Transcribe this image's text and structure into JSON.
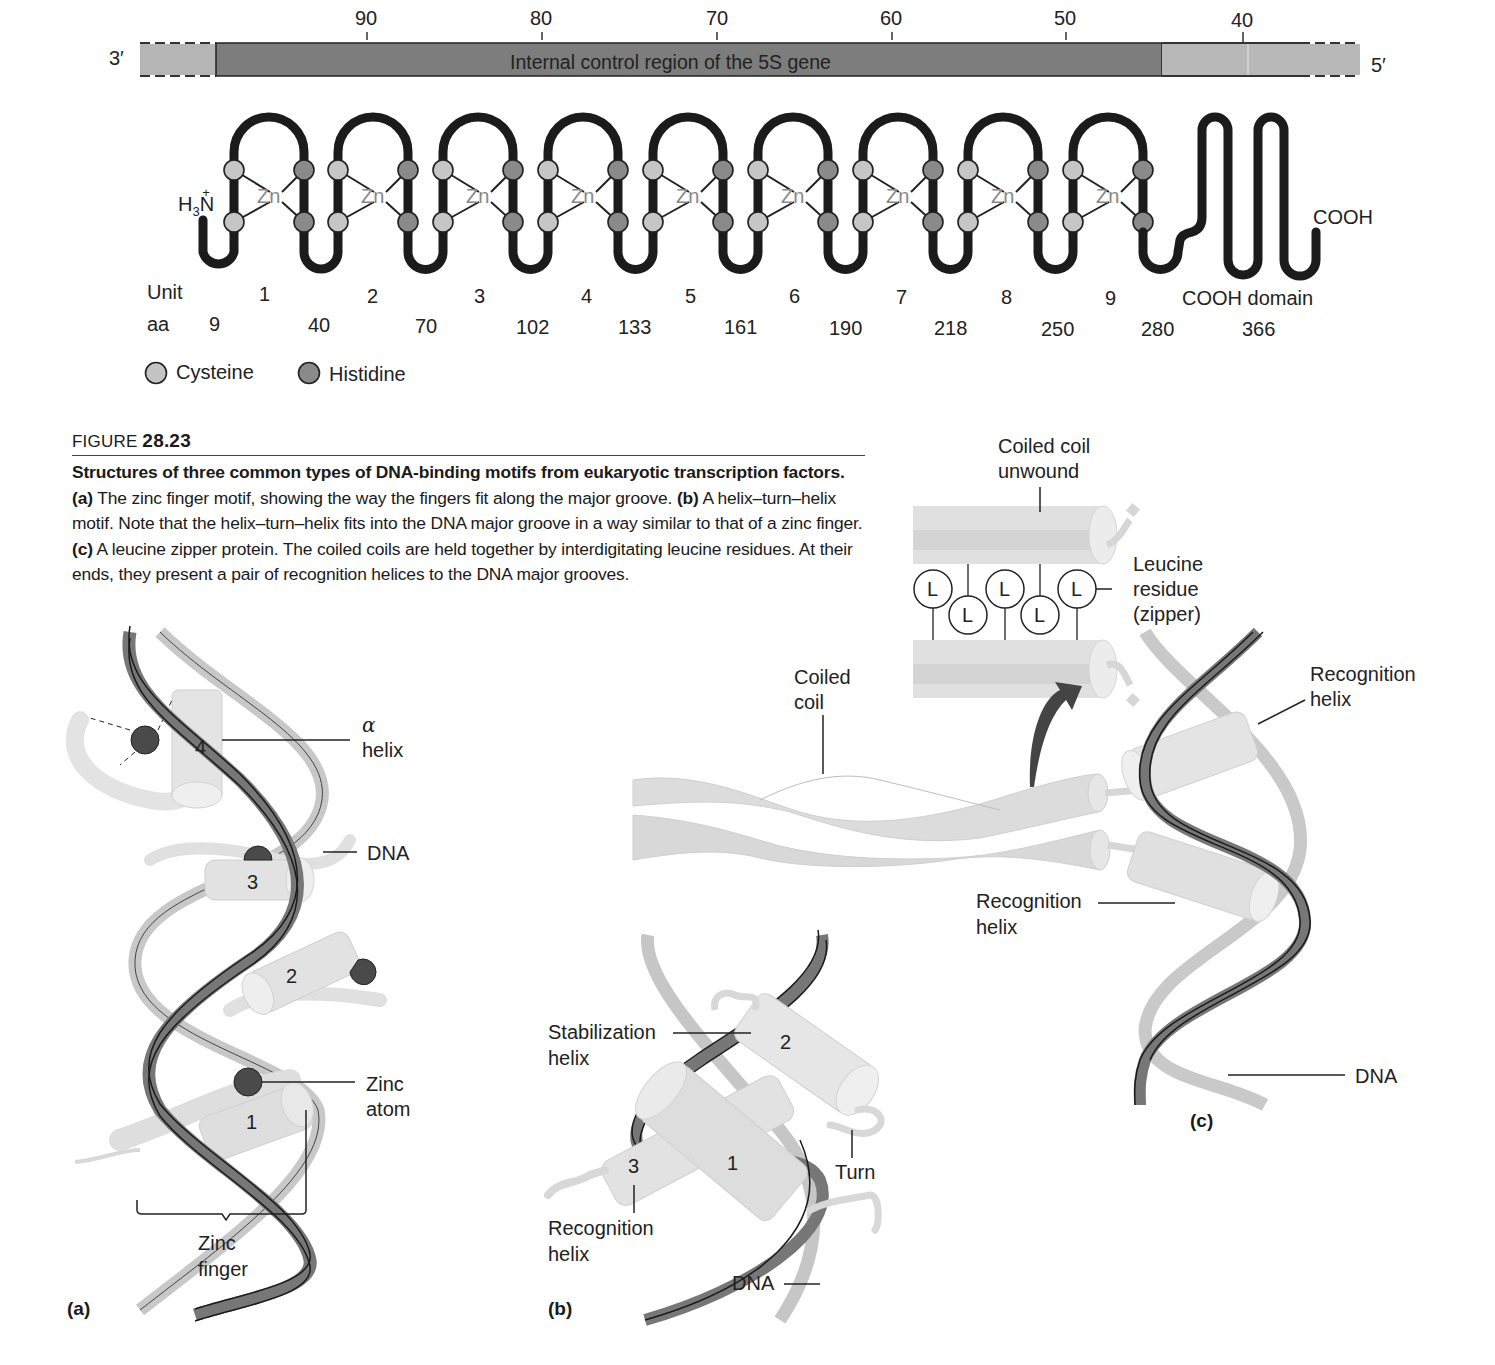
{
  "gene_bar": {
    "left_end": "3′",
    "right_end": "5′",
    "region_label": "Internal control region of the 5S gene",
    "ticks": [
      "90",
      "80",
      "70",
      "60",
      "50",
      "40"
    ],
    "colors": {
      "control_region": "#7d7d7d",
      "flank": "#b8b8b8"
    }
  },
  "protein": {
    "n_terminus": "H3N+",
    "n_terminus_main": "H",
    "n_terminus_sub": "3",
    "n_terminus_atom": "N",
    "n_terminus_charge": "+",
    "c_terminus": "COOH",
    "zinc_label": "Zn",
    "unit_row_label": "Unit",
    "aa_row_label": "aa",
    "units": [
      "1",
      "2",
      "3",
      "4",
      "5",
      "6",
      "7",
      "8",
      "9",
      "COOH domain"
    ],
    "aa_positions": [
      "9",
      "40",
      "70",
      "102",
      "133",
      "161",
      "190",
      "218",
      "250",
      "280",
      "366"
    ]
  },
  "legend": {
    "items": [
      {
        "label": "Cysteine",
        "color": "#c4c4c4"
      },
      {
        "label": "Histidine",
        "color": "#8a8a8a"
      }
    ]
  },
  "caption": {
    "figure_prefix": "FIGURE ",
    "figure_number": "28.23",
    "title": "Structures of three common types of DNA-binding motifs from eukaryotic transcription factors.",
    "part_a_tag": "(a)",
    "part_a_text": " The zinc finger motif, showing the way the fingers fit along the major groove. ",
    "part_b_tag": "(b)",
    "part_b_text": " A helix–turn–helix motif. Note that the helix–turn–helix fits into the DNA major groove in a way similar to that of a zinc finger. ",
    "part_c_tag": "(c)",
    "part_c_text": " A leucine zipper protein. The coiled coils are held together by interdigitating leucine residues. At their ends, they present a pair of recognition helices to the DNA major grooves."
  },
  "panel_a": {
    "tag": "(a)",
    "helix_numbers": [
      "4",
      "3",
      "2",
      "1"
    ],
    "labels": {
      "alpha": "α",
      "helix": "helix",
      "dna": "DNA",
      "zinc_atom_1": "Zinc",
      "zinc_atom_2": "atom",
      "zinc_finger_1": "Zinc",
      "zinc_finger_2": "finger"
    }
  },
  "panel_b": {
    "tag": "(b)",
    "helix_numbers": [
      "1",
      "2",
      "3"
    ],
    "labels": {
      "stabilization_1": "Stabilization",
      "stabilization_2": "helix",
      "recognition_1": "Recognition",
      "recognition_2": "helix",
      "turn": "Turn",
      "dna": "DNA"
    }
  },
  "panel_c": {
    "tag": "(c)",
    "leucine_symbol": "L",
    "labels": {
      "coiled_unwound_1": "Coiled coil",
      "coiled_unwound_2": "unwound",
      "leucine_1": "Leucine",
      "leucine_2": "residue",
      "leucine_3": "(zipper)",
      "coiled_coil_1": "Coiled",
      "coiled_coil_2": "coil",
      "recognition_top_1": "Recognition",
      "recognition_top_2": "helix",
      "recognition_bottom_1": "Recognition",
      "recognition_bottom_2": "helix",
      "dna": "DNA"
    }
  }
}
